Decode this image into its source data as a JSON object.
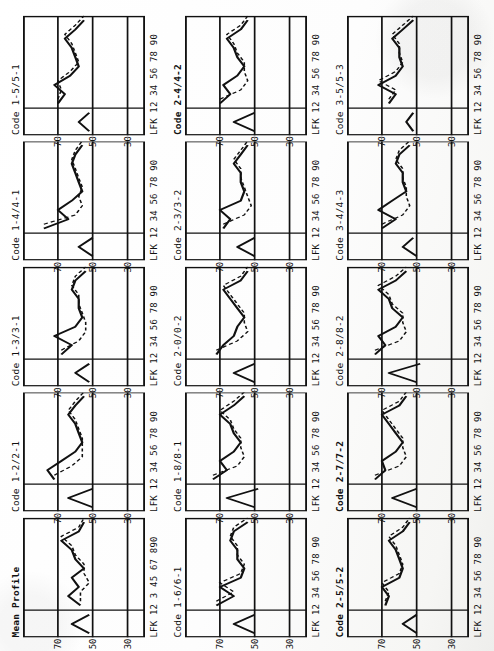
{
  "figure": {
    "kind": "small-multiples-profile-grid",
    "orientation_note": "page scanned sideways; charts rotated 90 degrees counter-clockwise",
    "rows": 3,
    "cols": 5,
    "y_ticks": [
      "70",
      "50",
      "30"
    ],
    "x_axis_label_default": "LFK  12 34 56 78 90",
    "x_axis_label_mean": "LFK  12 3 45 67 890",
    "colors": {
      "ink": "#1a1a1a",
      "paper": "#ffffff",
      "frame": "#111111"
    }
  },
  "chart_data": {
    "type": "line",
    "xlabel": "LFK  12 34 56 78 90",
    "ylabel": "T-score",
    "ylim": [
      20,
      90
    ],
    "yticks": [
      30,
      50,
      70
    ],
    "grid": true,
    "legend": "none",
    "x_categories": [
      "L",
      "F",
      "K",
      "1",
      "2",
      "3",
      "4",
      "5",
      "6",
      "7",
      "8",
      "9",
      "0"
    ],
    "series_note": "solid line = observed profile, dashed line = comparison/predicted profile",
    "panels": [
      {
        "title": "Mean Profile",
        "title_bold": true,
        "xlabel": "LFK  12 3 45 67 890",
        "solid": [
          52,
          62,
          52,
          57,
          64,
          58,
          62,
          55,
          60,
          62,
          68,
          58,
          55
        ],
        "dashed": [
          52,
          62,
          52,
          57,
          57,
          52,
          55,
          55,
          60,
          62,
          68,
          58,
          55
        ]
      },
      {
        "title": "Code 1-2/2-1",
        "title_bold": false,
        "xlabel": "LFK  12 34 56 78 90",
        "solid": [
          50,
          64,
          50,
          72,
          76,
          68,
          60,
          56,
          58,
          60,
          64,
          60,
          55
        ],
        "dashed": [
          50,
          64,
          50,
          72,
          62,
          56,
          56,
          56,
          58,
          60,
          64,
          60,
          55
        ]
      },
      {
        "title": "Code 1-3/3-1",
        "title_bold": false,
        "xlabel": "LFK  12 34 56 78 90",
        "solid": [
          52,
          60,
          52,
          68,
          62,
          72,
          60,
          56,
          58,
          58,
          62,
          60,
          54
        ],
        "dashed": [
          52,
          60,
          52,
          68,
          58,
          54,
          54,
          56,
          58,
          58,
          62,
          60,
          54
        ]
      },
      {
        "title": "Code 1-4/4-1",
        "title_bold": false,
        "xlabel": "LFK  12 34 56 78 90",
        "solid": [
          50,
          58,
          50,
          78,
          64,
          70,
          62,
          56,
          58,
          60,
          62,
          60,
          56
        ],
        "dashed": [
          50,
          58,
          50,
          78,
          60,
          56,
          58,
          56,
          58,
          60,
          62,
          60,
          56
        ]
      },
      {
        "title": "Code 1-5/5-1",
        "title_bold": false,
        "xlabel": "LFK  12 34 56 78 90",
        "solid": [
          52,
          58,
          52,
          70,
          66,
          72,
          63,
          58,
          60,
          62,
          66,
          60,
          55
        ],
        "dashed": [
          52,
          58,
          52,
          70,
          68,
          70,
          63,
          58,
          60,
          62,
          66,
          60,
          55
        ]
      },
      {
        "title": "Code 1-6/6-1",
        "title_bold": false,
        "xlabel": "LFK  12 34 56 78 90",
        "solid": [
          50,
          62,
          50,
          72,
          62,
          70,
          58,
          56,
          60,
          60,
          64,
          62,
          54
        ],
        "dashed": [
          50,
          62,
          50,
          72,
          62,
          70,
          58,
          56,
          60,
          60,
          64,
          62,
          54
        ]
      },
      {
        "title": "Code 1-8/8-1",
        "title_bold": false,
        "xlabel": "LFK  12 34 56 78 90",
        "solid": [
          50,
          66,
          48,
          74,
          66,
          70,
          62,
          58,
          62,
          64,
          70,
          62,
          56
        ],
        "dashed": [
          50,
          66,
          48,
          74,
          60,
          56,
          58,
          58,
          62,
          64,
          70,
          62,
          56
        ]
      },
      {
        "title": "Code 2-0/0-2",
        "title_bold": false,
        "xlabel": "LFK  12 34 56 78 90",
        "solid": [
          50,
          62,
          50,
          72,
          68,
          62,
          60,
          56,
          60,
          64,
          68,
          58,
          54
        ],
        "dashed": [
          50,
          62,
          50,
          72,
          60,
          54,
          56,
          56,
          60,
          64,
          68,
          58,
          54
        ]
      },
      {
        "title": "Code 2-3/3-2",
        "title_bold": false,
        "xlabel": "LFK  12 34 56 78 90",
        "solid": [
          50,
          60,
          50,
          68,
          64,
          70,
          58,
          56,
          58,
          58,
          62,
          58,
          54
        ],
        "dashed": [
          50,
          60,
          50,
          68,
          56,
          52,
          54,
          56,
          58,
          58,
          62,
          58,
          54
        ]
      },
      {
        "title": "Code 2-4/4-2",
        "title_bold": true,
        "xlabel": "LFK  12 34 56 78 90",
        "solid": [
          50,
          62,
          50,
          70,
          64,
          68,
          60,
          56,
          60,
          62,
          66,
          58,
          54
        ],
        "dashed": [
          50,
          62,
          50,
          70,
          58,
          54,
          56,
          56,
          60,
          62,
          66,
          58,
          54
        ]
      },
      {
        "title": "Code 2-5/5-2",
        "title_bold": true,
        "xlabel": "LFK  12 34 56 78 90",
        "solid": [
          50,
          58,
          50,
          68,
          66,
          70,
          60,
          58,
          60,
          62,
          66,
          58,
          54
        ],
        "dashed": [
          50,
          58,
          50,
          68,
          66,
          70,
          60,
          58,
          60,
          62,
          66,
          58,
          54
        ]
      },
      {
        "title": "Code 2-7/7-2",
        "title_bold": true,
        "xlabel": "LFK  12 34 56 78 90",
        "solid": [
          50,
          64,
          50,
          74,
          68,
          70,
          62,
          58,
          62,
          66,
          70,
          60,
          56
        ],
        "dashed": [
          50,
          64,
          50,
          74,
          60,
          56,
          58,
          58,
          62,
          66,
          70,
          60,
          56
        ]
      },
      {
        "title": "Code 2-8/8-2",
        "title_bold": false,
        "xlabel": "LFK  12 34 56 78 90",
        "solid": [
          50,
          66,
          48,
          74,
          68,
          72,
          62,
          58,
          64,
          66,
          72,
          62,
          56
        ],
        "dashed": [
          50,
          66,
          48,
          74,
          60,
          56,
          58,
          58,
          64,
          66,
          72,
          62,
          56
        ]
      },
      {
        "title": "Code 3-4/4-3",
        "title_bold": false,
        "xlabel": "LFK  12 34 56 78 90",
        "solid": [
          50,
          58,
          52,
          70,
          62,
          72,
          64,
          56,
          58,
          58,
          62,
          60,
          54
        ],
        "dashed": [
          50,
          58,
          52,
          70,
          58,
          54,
          56,
          56,
          58,
          58,
          62,
          60,
          54
        ]
      },
      {
        "title": "Code 3-5/5-3",
        "title_bold": false,
        "xlabel": "LFK  12 34 56 78 90",
        "solid": [
          52,
          56,
          52,
          66,
          62,
          72,
          62,
          58,
          60,
          60,
          64,
          58,
          52
        ],
        "dashed": [
          52,
          56,
          52,
          66,
          62,
          72,
          62,
          58,
          60,
          60,
          64,
          58,
          52
        ]
      }
    ]
  }
}
